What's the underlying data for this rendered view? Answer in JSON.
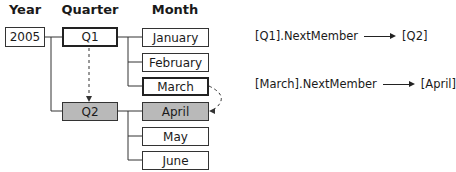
{
  "headers": {
    "year": "Year",
    "quarter": "Quarter",
    "month": "Month"
  },
  "year": {
    "label": "2005"
  },
  "quarters": [
    {
      "label": "Q1",
      "highlight": "bold"
    },
    {
      "label": "Q2",
      "highlight": "gray"
    }
  ],
  "months": [
    {
      "label": "January"
    },
    {
      "label": "February"
    },
    {
      "label": "March",
      "highlight": "bold"
    },
    {
      "label": "April",
      "highlight": "gray"
    },
    {
      "label": "May"
    },
    {
      "label": "June"
    }
  ],
  "expressions": [
    {
      "expr": "[Q1].NextMember",
      "result": "[Q2]"
    },
    {
      "expr": "[March].NextMember",
      "result": "[April]"
    }
  ],
  "colors": {
    "highlight_fill": "#b9b9b9",
    "line": "#333333"
  }
}
